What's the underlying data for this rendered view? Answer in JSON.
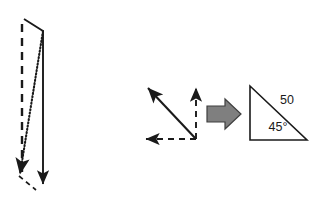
{
  "figure": {
    "background_color": "#ffffff",
    "stroke_color": "#1a1a1a",
    "accent_color": "#7f7f7f",
    "panels": [
      {
        "name": "left-vector-triangle",
        "description": "Tall narrow triangle formed by a solid resultant vector, a dashed vertical component and a dotted component"
      },
      {
        "name": "middle-vector-triangle",
        "description": "Solid diagonal vector up-left with dashed vertical up component and dashed horizontal left component"
      },
      {
        "name": "transform-arrow",
        "description": "Gray block arrow pointing right"
      },
      {
        "name": "right-labeled-triangle",
        "description": "Right triangle with hypotenuse labeled 50 and interior angle labeled 45 degrees"
      }
    ]
  },
  "labels": {
    "hypotenuse": "50",
    "angle": "45°"
  },
  "colors": {
    "stroke": "#1a1a1a",
    "block_arrow_fill": "#7f7f7f",
    "block_arrow_stroke": "#3f3f3f"
  }
}
